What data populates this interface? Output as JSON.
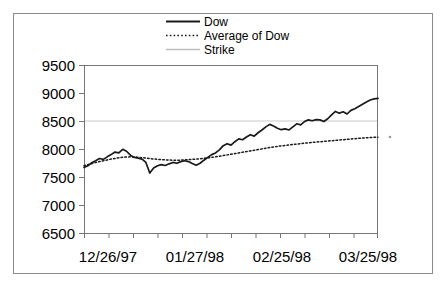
{
  "chart_data": {
    "type": "line",
    "title": "",
    "xlabel": "",
    "ylabel": "",
    "grid": "horizontal-strike-only",
    "legend_position": "top-center",
    "ylim": [
      6500,
      9500
    ],
    "ytick_labels": [
      "9500",
      "9000",
      "8500",
      "8000",
      "7500",
      "7000",
      "6500"
    ],
    "yticks": [
      9500,
      9000,
      8500,
      8000,
      7500,
      7000,
      6500
    ],
    "xtick_labels": [
      "12/26/97",
      "01/27/98",
      "02/25/98",
      "03/25/98"
    ],
    "x_tick_count": 13,
    "legend": [
      {
        "label": "Dow",
        "style": "solid",
        "color": "#1a1a1a"
      },
      {
        "label": "Average of Dow",
        "style": "dotted",
        "color": "#1a1a1a"
      },
      {
        "label": "Strike",
        "style": "solid-light",
        "color": "#bfbfbf"
      }
    ],
    "strike_value": 8500,
    "series": [
      {
        "name": "Dow",
        "style": "solid",
        "values": [
          7670,
          7700,
          7755,
          7790,
          7830,
          7815,
          7860,
          7900,
          7945,
          7930,
          7995,
          7960,
          7890,
          7850,
          7835,
          7820,
          7760,
          7570,
          7660,
          7700,
          7720,
          7705,
          7735,
          7760,
          7745,
          7775,
          7790,
          7775,
          7740,
          7710,
          7745,
          7800,
          7850,
          7900,
          7930,
          7985,
          8060,
          8095,
          8070,
          8130,
          8180,
          8165,
          8215,
          8255,
          8230,
          8290,
          8340,
          8395,
          8440,
          8410,
          8370,
          8345,
          8360,
          8340,
          8395,
          8450,
          8430,
          8490,
          8520,
          8505,
          8525,
          8520,
          8490,
          8540,
          8610,
          8670,
          8640,
          8665,
          8625,
          8690,
          8720,
          8760,
          8800,
          8840,
          8875,
          8895,
          8905
        ]
      },
      {
        "name": "Average of Dow",
        "style": "dotted",
        "values": [
          7700,
          7720,
          7740,
          7760,
          7775,
          7790,
          7805,
          7820,
          7832,
          7843,
          7852,
          7858,
          7860,
          7858,
          7852,
          7845,
          7838,
          7830,
          7822,
          7816,
          7810,
          7806,
          7802,
          7800,
          7800,
          7802,
          7806,
          7810,
          7815,
          7820,
          7826,
          7833,
          7841,
          7850,
          7860,
          7871,
          7883,
          7895,
          7906,
          7918,
          7930,
          7942,
          7954,
          7966,
          7978,
          7990,
          8002,
          8014,
          8026,
          8037,
          8047,
          8056,
          8064,
          8072,
          8080,
          8088,
          8096,
          8104,
          8111,
          8118,
          8124,
          8130,
          8136,
          8142,
          8148,
          8154,
          8160,
          8166,
          8172,
          8178,
          8184,
          8190,
          8195,
          8200,
          8205,
          8209,
          8212
        ]
      }
    ]
  },
  "axes": {
    "y_labels": [
      "9500",
      "9000",
      "8500",
      "8000",
      "7500",
      "7000",
      "6500"
    ],
    "x_labels": [
      "12/26/97",
      "01/27/98",
      "02/25/98",
      "03/25/98"
    ]
  },
  "legend": {
    "dow": "Dow",
    "average": "Average of Dow",
    "strike": "Strike"
  }
}
